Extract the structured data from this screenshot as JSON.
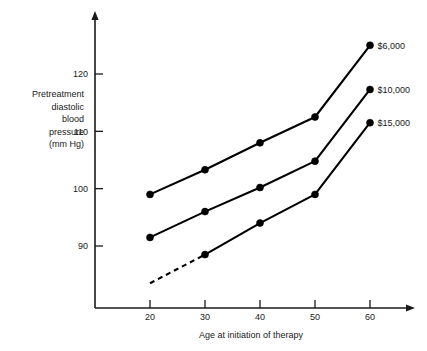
{
  "chart_data": {
    "type": "line",
    "title": "",
    "xlabel": "Age at initiation of therapy",
    "ylabel": "Pretreatment diastolic blood pressure (mm Hg)",
    "ylabel_lines": [
      "Pretreatment",
      "diastolic",
      "blood",
      "pressure",
      "(mm Hg)"
    ],
    "x": [
      20,
      30,
      40,
      50,
      60
    ],
    "xticklabels": [
      "20",
      "30",
      "40",
      "50",
      "60"
    ],
    "yticks": [
      90,
      100,
      110,
      120
    ],
    "yticklabels": [
      "90",
      "100",
      "110",
      "120"
    ],
    "xlim": [
      14,
      66
    ],
    "ylim": [
      85,
      127
    ],
    "grid": false,
    "legend_position": "right-of-endpoints",
    "series": [
      {
        "name": "$6,000",
        "label": "$6,000",
        "values": [
          99.0,
          103.3,
          108.0,
          112.5,
          125.0
        ],
        "dashed_leading_segment": false,
        "color": "#000000"
      },
      {
        "name": "$10,000",
        "label": "$10,000",
        "values": [
          91.5,
          96.0,
          100.2,
          104.8,
          117.3
        ],
        "dashed_leading_segment": false,
        "color": "#000000"
      },
      {
        "name": "$15,000",
        "label": "$15,000",
        "values": [
          null,
          88.5,
          94.0,
          99.0,
          111.5
        ],
        "dashed_leading_segment": true,
        "dashed_from": {
          "x": 20,
          "y": 83.5
        },
        "color": "#000000"
      }
    ]
  },
  "axes": {
    "y_arrow": true,
    "x_arrow": true
  }
}
